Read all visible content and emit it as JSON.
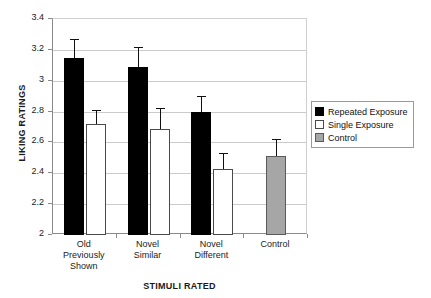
{
  "chart_data": {
    "type": "bar",
    "title": "",
    "xlabel": "STIMULI RATED",
    "ylabel": "LIKING RATINGS",
    "ylim": [
      2,
      3.4
    ],
    "ytick_step": 0.2,
    "yticks": [
      "3.4",
      "3.2",
      "3",
      "2.8",
      "2.6",
      "2.4",
      "2.2",
      "2"
    ],
    "grid": true,
    "legend_position": "right",
    "categories": [
      "Old Previously Shown",
      "Novel Similar",
      "Novel Different",
      "Control"
    ],
    "category_labels": [
      "Old\nPreviously\nShown",
      "Novel\nSimilar",
      "Novel\nDifferent",
      "Control"
    ],
    "series": [
      {
        "name": "Repeated Exposure",
        "color": "#000000",
        "values": [
          3.15,
          3.09,
          2.8,
          null
        ],
        "errors": [
          0.12,
          0.13,
          0.1,
          null
        ]
      },
      {
        "name": "Single Exposure",
        "color": "#ffffff",
        "values": [
          2.72,
          2.69,
          2.43,
          null
        ],
        "errors": [
          0.09,
          0.13,
          0.1,
          null
        ]
      },
      {
        "name": "Control",
        "color": "#a6a6a6",
        "values": [
          null,
          null,
          null,
          2.51
        ],
        "errors": [
          null,
          null,
          null,
          0.11
        ]
      }
    ]
  },
  "legend": {
    "items": [
      {
        "label": "Repeated Exposure",
        "swatch": "black"
      },
      {
        "label": "Single Exposure",
        "swatch": "white"
      },
      {
        "label": "Control",
        "swatch": "gray"
      }
    ]
  }
}
